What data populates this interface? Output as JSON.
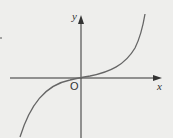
{
  "diagram": {
    "axes": {
      "x_label": "x",
      "y_label": "y",
      "origin_label": "O"
    },
    "colors": {
      "background": "#eeeeec",
      "axis": "#333333",
      "curve": "#666666"
    },
    "curve": {
      "shape": "cubic",
      "passes_through": "origin",
      "monotonic": "increasing"
    }
  }
}
